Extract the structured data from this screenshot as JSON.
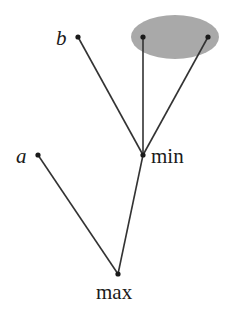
{
  "diagram": {
    "type": "game-tree",
    "colors": {
      "edge": "#333333",
      "node": "#1a1a1a",
      "highlight": "#a9a9a9"
    },
    "nodes": [
      {
        "id": "max",
        "label": "max",
        "x": 118,
        "y": 274
      },
      {
        "id": "a",
        "label": "a",
        "x": 38,
        "y": 155
      },
      {
        "id": "min",
        "label": "min",
        "x": 143,
        "y": 155
      },
      {
        "id": "b",
        "label": "b",
        "x": 78,
        "y": 37
      },
      {
        "id": "c1",
        "label": "",
        "x": 143,
        "y": 37
      },
      {
        "id": "c2",
        "label": "",
        "x": 208,
        "y": 37
      }
    ],
    "edges": [
      {
        "from": "max",
        "to": "a"
      },
      {
        "from": "max",
        "to": "min"
      },
      {
        "from": "min",
        "to": "b"
      },
      {
        "from": "min",
        "to": "c1"
      },
      {
        "from": "min",
        "to": "c2"
      }
    ],
    "highlight_region": {
      "cx": 175,
      "cy": 37,
      "rx": 44,
      "ry": 22,
      "contains": [
        "c1",
        "c2"
      ]
    },
    "labels": {
      "max": "max",
      "min": "min",
      "a": "a",
      "b": "b"
    }
  }
}
